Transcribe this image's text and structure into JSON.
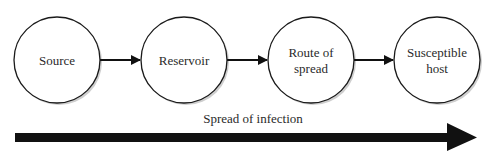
{
  "diagram": {
    "nodes": [
      {
        "id": "source",
        "lines": [
          "Source"
        ],
        "cx": 57
      },
      {
        "id": "reservoir",
        "lines": [
          "Reservoir"
        ],
        "cx": 184
      },
      {
        "id": "route",
        "lines": [
          "Route of",
          "spread"
        ],
        "cx": 311
      },
      {
        "id": "host",
        "lines": [
          "Susceptible",
          "host"
        ],
        "cx": 437
      }
    ],
    "edges": [
      {
        "from": "source",
        "to": "reservoir"
      },
      {
        "from": "reservoir",
        "to": "route"
      },
      {
        "from": "route",
        "to": "host"
      }
    ],
    "caption": "Spread of infection",
    "colors": {
      "stroke": "#1a1a1a",
      "fill": "#ffffff",
      "shadow": "#c8c8c8",
      "arrow": "#111111"
    }
  }
}
